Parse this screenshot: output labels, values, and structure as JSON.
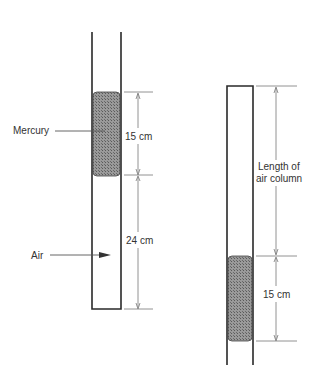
{
  "diagram": {
    "left_tube": {
      "label_mercury": "Mercury",
      "label_air": "Air",
      "mercury_length": "15 cm",
      "air_length": "24 cm"
    },
    "right_tube": {
      "air_length_line1": "Length of",
      "air_length_line2": "air column",
      "mercury_length": "15 cm"
    },
    "colors": {
      "tube": "#2a2a2a",
      "mercury": "#8a8a8a",
      "dimension": "#666666"
    }
  }
}
